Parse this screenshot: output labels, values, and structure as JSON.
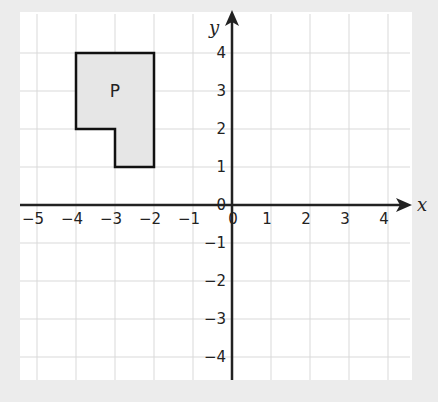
{
  "diagram": {
    "type": "coordinate-grid",
    "axes": {
      "x_label": "x",
      "y_label": "y",
      "x_range": [
        -5,
        4
      ],
      "y_range": [
        -4,
        4
      ],
      "x_ticks": [
        "−5",
        "−4",
        "−3",
        "−2",
        "−1",
        "0",
        "1",
        "2",
        "3",
        "4"
      ],
      "y_ticks": [
        "4",
        "3",
        "2",
        "1",
        "0",
        "−1",
        "−2",
        "−3",
        "−4"
      ]
    },
    "shape": {
      "label": "P",
      "vertices": [
        [
          -4,
          4
        ],
        [
          -2,
          4
        ],
        [
          -2,
          1
        ],
        [
          -3,
          1
        ],
        [
          -3,
          2
        ],
        [
          -4,
          2
        ]
      ],
      "fill": "#e6e6e6",
      "stroke": "#111111"
    },
    "colors": {
      "background": "#ececec",
      "panel": "#ffffff",
      "grid": "#d9d9d9",
      "axis": "#222222"
    }
  }
}
